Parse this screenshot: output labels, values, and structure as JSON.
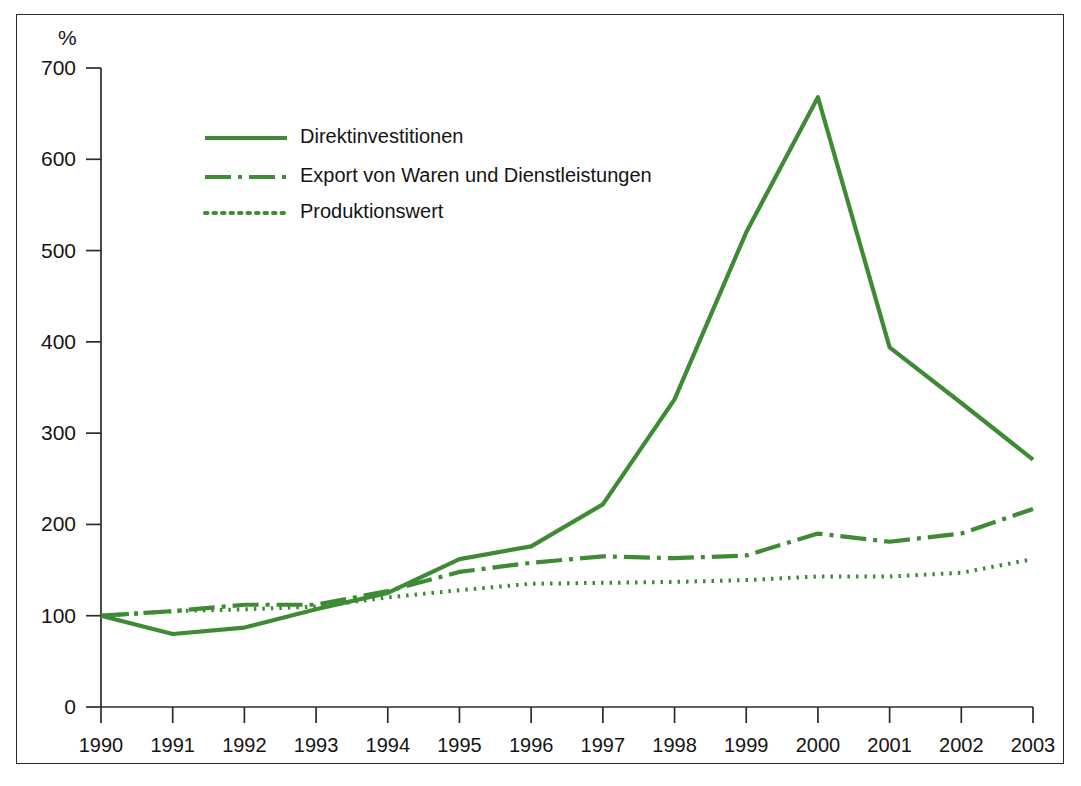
{
  "chart_data": {
    "type": "line",
    "title": "",
    "xlabel": "",
    "ylabel": "%",
    "y_unit_label": "%",
    "categories": [
      "1990",
      "1991",
      "1992",
      "1993",
      "1994",
      "1995",
      "1996",
      "1997",
      "1998",
      "1999",
      "2000",
      "2001",
      "2002",
      "2003"
    ],
    "x": [
      1990,
      1991,
      1992,
      1993,
      1994,
      1995,
      1996,
      1997,
      1998,
      1999,
      2000,
      2001,
      2002,
      2003
    ],
    "xlim": [
      1990,
      2003
    ],
    "ylim": [
      0,
      700
    ],
    "y_ticks": [
      0,
      100,
      200,
      300,
      400,
      500,
      600,
      700
    ],
    "y_tick_labels": [
      "0",
      "100",
      "200",
      "300",
      "400",
      "500",
      "600",
      "700"
    ],
    "grid": false,
    "legend_position": "upper-left-inside",
    "series": [
      {
        "name": "Direktinvestitionen",
        "style": "solid",
        "color": "#3f8a35",
        "values": [
          100,
          80,
          87,
          107,
          125,
          162,
          176,
          222,
          337,
          520,
          668,
          394,
          333,
          271
        ]
      },
      {
        "name": "Export von Waren und Dienstleistungen",
        "style": "dash-dot",
        "color": "#3f8a35",
        "values": [
          100,
          105,
          112,
          112,
          127,
          148,
          158,
          165,
          163,
          166,
          190,
          181,
          190,
          217
        ]
      },
      {
        "name": "Produktionswert",
        "style": "dotted",
        "color": "#3f8a35",
        "values": [
          100,
          105,
          107,
          110,
          120,
          128,
          135,
          136,
          137,
          139,
          143,
          143,
          147,
          162
        ]
      }
    ]
  },
  "legend": {
    "items": [
      {
        "label": "Direktinvestitionen",
        "style": "solid"
      },
      {
        "label": "Export von Waren und Dienstleistungen",
        "style": "dash-dot"
      },
      {
        "label": "Produktionswert",
        "style": "dotted"
      }
    ]
  },
  "colors": {
    "series_green": "#3f8a35",
    "axis_black": "#2b2b2b",
    "background": "#ffffff"
  }
}
